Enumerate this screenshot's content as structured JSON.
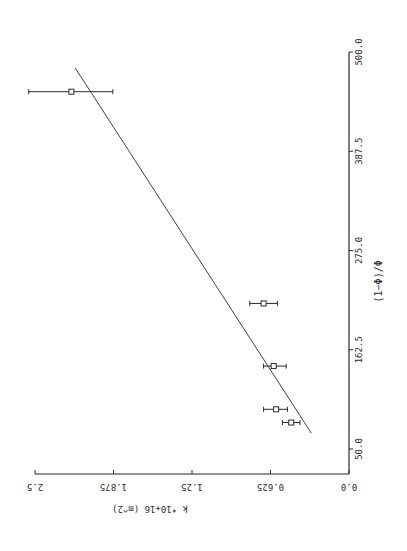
{
  "chart_data": {
    "type": "scatter",
    "title": "",
    "orientation_note": "figure printed rotated 90 degrees",
    "xlabel": "(1−Φ)/Φ",
    "ylabel": "k *10+16 (m^2)",
    "xlim": [
      50.0,
      500.0
    ],
    "ylim": [
      0.0,
      2.5
    ],
    "xticks": [
      "50.0",
      "162.5",
      "275.0",
      "387.5",
      "500.0"
    ],
    "yticks": [
      "0.0",
      "0.625",
      "1.25",
      "1.875",
      "2.5"
    ],
    "grid": false,
    "legend": null,
    "series": [
      {
        "name": "measured",
        "marker": "open-square",
        "points": [
          {
            "x": 80,
            "y": 0.46,
            "err_low": 0.39,
            "err_high": 0.53
          },
          {
            "x": 95,
            "y": 0.58,
            "err_low": 0.49,
            "err_high": 0.68
          },
          {
            "x": 144,
            "y": 0.6,
            "err_low": 0.5,
            "err_high": 0.68
          },
          {
            "x": 215,
            "y": 0.68,
            "err_low": 0.57,
            "err_high": 0.79
          },
          {
            "x": 455,
            "y": 2.21,
            "err_low": 1.88,
            "err_high": 2.55
          }
        ]
      },
      {
        "name": "linear fit",
        "type": "line",
        "points": [
          {
            "x": 68,
            "y": 0.3
          },
          {
            "x": 482,
            "y": 2.18
          }
        ]
      }
    ]
  },
  "colors": {
    "ink": "#2a2a2a",
    "background": "#ffffff"
  }
}
